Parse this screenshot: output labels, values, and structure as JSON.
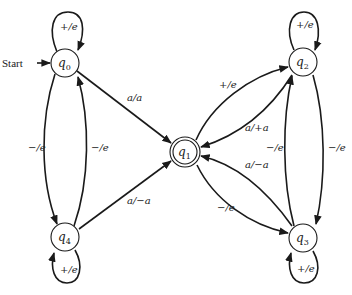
{
  "diagram": {
    "type": "finite-state transducer",
    "start_label": "Start",
    "nodes": [
      {
        "id": "q0",
        "name": "q",
        "sub": "0",
        "accepting": false,
        "start": true
      },
      {
        "id": "q1",
        "name": "q",
        "sub": "1",
        "accepting": true,
        "start": false
      },
      {
        "id": "q2",
        "name": "q",
        "sub": "2",
        "accepting": false,
        "start": false
      },
      {
        "id": "q3",
        "name": "q",
        "sub": "3",
        "accepting": false,
        "start": false
      },
      {
        "id": "q4",
        "name": "q",
        "sub": "4",
        "accepting": false,
        "start": false
      }
    ],
    "edges": [
      {
        "id": "q0-q0",
        "from": "q0",
        "to": "q0",
        "label": "+/e"
      },
      {
        "id": "q0-q1",
        "from": "q0",
        "to": "q1",
        "label": "a/a"
      },
      {
        "id": "q0-q4",
        "from": "q0",
        "to": "q4",
        "label": "−/e"
      },
      {
        "id": "q4-q0",
        "from": "q4",
        "to": "q0",
        "label": "−/e"
      },
      {
        "id": "q4-q4",
        "from": "q4",
        "to": "q4",
        "label": "+/e"
      },
      {
        "id": "q4-q1",
        "from": "q4",
        "to": "q1",
        "label": "a/−a"
      },
      {
        "id": "q1-q2",
        "from": "q1",
        "to": "q2",
        "label": "+/e"
      },
      {
        "id": "q2-q1",
        "from": "q2",
        "to": "q1",
        "label": "a/+a"
      },
      {
        "id": "q2-q2",
        "from": "q2",
        "to": "q2",
        "label": "+/e"
      },
      {
        "id": "q3-q2",
        "from": "q3",
        "to": "q2",
        "label": "−/e"
      },
      {
        "id": "q2-q3",
        "from": "q2",
        "to": "q3",
        "label": "−/e"
      },
      {
        "id": "q3-q1",
        "from": "q3",
        "to": "q1",
        "label": "a/−a"
      },
      {
        "id": "q1-q3",
        "from": "q1",
        "to": "q3",
        "label": "−/e"
      },
      {
        "id": "q3-q3",
        "from": "q3",
        "to": "q3",
        "label": "+/e"
      }
    ]
  }
}
